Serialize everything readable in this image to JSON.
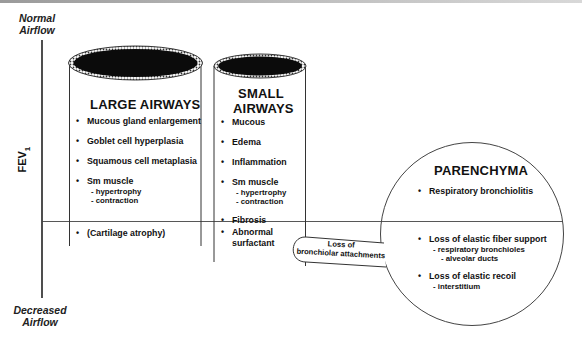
{
  "axis": {
    "top_label_line1": "Normal",
    "top_label_line2": "Airflow",
    "bottom_label_line1": "Decreased",
    "bottom_label_line2": "Airflow",
    "y_label": "FEV",
    "y_label_sub": "1"
  },
  "large_airways": {
    "title": "LARGE AIRWAYS",
    "above_threshold": [
      {
        "label": "Mucous gland enlargement",
        "subs": []
      },
      {
        "label": "Goblet cell hyperplasia",
        "subs": []
      },
      {
        "label": "Squamous cell metaplasia",
        "subs": []
      },
      {
        "label": "Sm muscle",
        "subs": [
          "- hypertrophy",
          "- contraction"
        ]
      }
    ],
    "below_threshold": [
      {
        "label": "(Cartilage atrophy)",
        "subs": []
      }
    ]
  },
  "small_airways": {
    "title_line1": "SMALL",
    "title_line2": "AIRWAYS",
    "above_threshold": [
      {
        "label": "Mucous",
        "subs": []
      },
      {
        "label": "Edema",
        "subs": []
      },
      {
        "label": "Inflammation",
        "subs": []
      },
      {
        "label": "Sm muscle",
        "subs": [
          "- hypertrophy",
          "- contraction"
        ]
      },
      {
        "label": "Fibrosis",
        "subs": []
      }
    ],
    "below_threshold": [
      {
        "label": "Abnormal",
        "label_line2": "surfactant"
      }
    ]
  },
  "connector": {
    "line1": "Loss of",
    "line2": "bronchiolar attachments"
  },
  "parenchyma": {
    "title": "PARENCHYMA",
    "above_threshold": [
      {
        "label": "Respiratory bronchiolitis",
        "subs": []
      }
    ],
    "below_threshold": [
      {
        "label": "Loss of elastic fiber support",
        "subs": [
          "- respiratory bronchioles",
          "- alveolar ducts"
        ]
      },
      {
        "label": "Loss of elastic recoil",
        "subs": [
          "- interstitium"
        ]
      }
    ]
  }
}
